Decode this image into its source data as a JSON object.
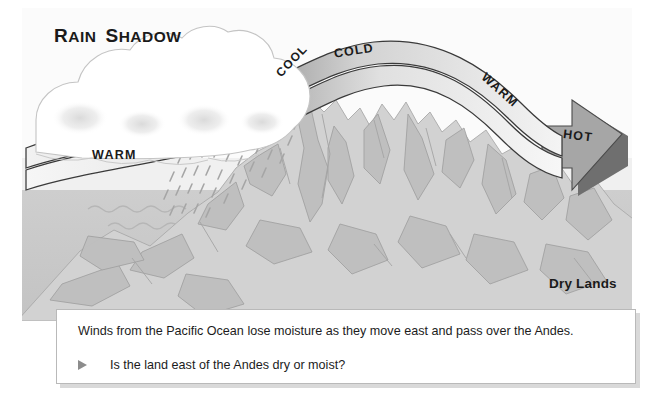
{
  "diagram": {
    "title_parts": {
      "word1_first": "R",
      "word1_rest": "AIN",
      "word2_first": "S",
      "word2_rest": "HADOW"
    },
    "labels": {
      "warm_left": "WARM",
      "cool": "COOL",
      "cold": "COLD",
      "warm_right": "WARM",
      "hot": "HOT",
      "dry_lands": "Dry Lands"
    },
    "features": {
      "clouds": "cloud-bank-icon",
      "rain": "rain-dashes-icon",
      "ocean": "ocean-waves-icon",
      "mountain": "andes-mountain-icon",
      "airflow": "wind-arrow-icon"
    },
    "colors": {
      "sky": "#fbfbfb",
      "ocean": "#c9c9c9",
      "mountain_light": "#d2d2d2",
      "mountain_shade": "#bdbdbd",
      "band_fill": "#ededed",
      "band_crest": "#a8a8a8",
      "arrow_head": "#a6a6a6",
      "arrow_edge": "#6f6f6f",
      "outline": "#3d3d3d",
      "text": "#1a1a1a",
      "caption_bg": "#ffffff",
      "caption_border": "#b9b9b9",
      "bullet": "#8c8c8c"
    }
  },
  "caption": {
    "body": "Winds from the Pacific Ocean lose moisture as they move east and pass over the Andes.",
    "question": "Is the land east of the Andes dry or moist?",
    "bullet_icon": "triangle-right-icon"
  }
}
